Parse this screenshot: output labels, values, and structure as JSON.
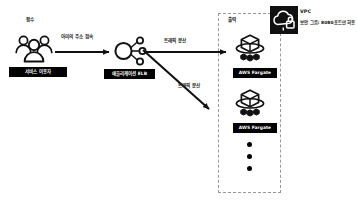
{
  "diagram": {
    "title_top_left": "함수",
    "nodes": {
      "users": {
        "icon": "users-group-icon",
        "label": "서비스 이용자"
      },
      "elb": {
        "icon": "application-load-balancer-icon",
        "label": "애플리케이션 ELB"
      },
      "fargate_1": {
        "icon": "aws-fargate-icon",
        "label": "AWS Fargate"
      },
      "fargate_2": {
        "icon": "aws-fargate-icon",
        "label": "AWS Fargate"
      }
    },
    "edges": {
      "users_to_elb": "아미의 주소 접속",
      "elb_to_fargate_1": "트래픽 분산",
      "elb_to_fargate_2": "트래픽 분산"
    },
    "vpc": {
      "group_label": "출력",
      "badge_icon": "vpc-cloud-lock-icon",
      "badge_title": "VPC",
      "badge_subtitle": "보안 그룹: 8080포트만 허용"
    },
    "ellipsis": {
      "name": "more-instances-ellipsis",
      "count": 3
    },
    "colors": {
      "ink": "#111111",
      "chip_bg": "#000000",
      "chip_text": "#ffffff",
      "dashed_border": "#9a9a9a",
      "background": "#ffffff"
    }
  }
}
